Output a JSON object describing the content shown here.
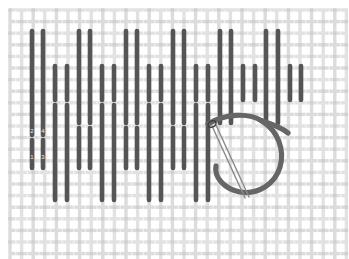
{
  "figure": {
    "width": 349,
    "height": 259
  },
  "colors": {
    "background": "#ffffff",
    "fabric_warp": "#e2e2e2",
    "fabric_weft": "#dcdcdc",
    "fabric_cross": "#d0d0d0",
    "stitch": "#555555",
    "stitch_dark": "#4a4a4a",
    "thread": "#666666",
    "needle": "#8a8a8a",
    "digit_label": "#ececec"
  },
  "fabric": {
    "type": "even-weave-canvas",
    "origin_x": 10,
    "origin_y": 10,
    "extent_x": 338,
    "extent_y": 250,
    "pitch": 11.6,
    "thread_width": 3.4,
    "gap_width": 1.2
  },
  "stitch_style": {
    "width": 4.6,
    "cap": "round",
    "color": "#555555"
  },
  "stitch_columns": [
    {
      "id": "c01",
      "x": 32,
      "segments": [
        [
          31,
          135
        ],
        [
          140,
          168
        ]
      ]
    },
    {
      "id": "c02",
      "x": 43,
      "segments": [
        [
          31,
          135
        ],
        [
          140,
          168
        ]
      ]
    },
    {
      "id": "c03",
      "x": 55,
      "segments": [
        [
          66,
          100
        ],
        [
          105,
          200
        ]
      ]
    },
    {
      "id": "c04",
      "x": 67,
      "segments": [
        [
          66,
          100
        ],
        [
          105,
          200
        ]
      ]
    },
    {
      "id": "c05",
      "x": 79,
      "segments": [
        [
          31,
          123
        ],
        [
          128,
          168
        ]
      ]
    },
    {
      "id": "c06",
      "x": 90,
      "segments": [
        [
          31,
          123
        ],
        [
          128,
          168
        ]
      ]
    },
    {
      "id": "c07",
      "x": 102,
      "segments": [
        [
          66,
          100
        ],
        [
          105,
          200
        ]
      ]
    },
    {
      "id": "c08",
      "x": 114,
      "segments": [
        [
          66,
          100
        ],
        [
          105,
          200
        ]
      ]
    },
    {
      "id": "c09",
      "x": 126,
      "segments": [
        [
          31,
          123
        ],
        [
          128,
          168
        ]
      ]
    },
    {
      "id": "c10",
      "x": 137,
      "segments": [
        [
          31,
          123
        ],
        [
          128,
          168
        ]
      ]
    },
    {
      "id": "c11",
      "x": 149,
      "segments": [
        [
          66,
          100
        ],
        [
          105,
          200
        ]
      ]
    },
    {
      "id": "c12",
      "x": 161,
      "segments": [
        [
          66,
          100
        ],
        [
          105,
          200
        ]
      ]
    },
    {
      "id": "c13",
      "x": 173,
      "segments": [
        [
          31,
          123
        ],
        [
          128,
          168
        ]
      ]
    },
    {
      "id": "c14",
      "x": 184,
      "segments": [
        [
          31,
          123
        ],
        [
          128,
          168
        ]
      ]
    },
    {
      "id": "c15",
      "x": 196,
      "segments": [
        [
          66,
          100
        ],
        [
          105,
          200
        ]
      ]
    },
    {
      "id": "c16",
      "x": 208,
      "segments": [
        [
          66,
          100
        ],
        [
          105,
          200
        ]
      ]
    },
    {
      "id": "c17",
      "x": 220,
      "segments": [
        [
          31,
          123
        ]
      ]
    },
    {
      "id": "c18",
      "x": 231,
      "segments": [
        [
          31,
          123
        ]
      ]
    },
    {
      "id": "c19",
      "x": 243,
      "segments": [
        [
          66,
          100
        ]
      ]
    },
    {
      "id": "c20",
      "x": 255,
      "segments": [
        [
          66,
          100
        ]
      ]
    },
    {
      "id": "c21",
      "x": 266,
      "segments": [
        [
          31,
          123
        ]
      ]
    },
    {
      "id": "c22",
      "x": 278,
      "segments": [
        [
          31,
          123
        ]
      ]
    },
    {
      "id": "c23",
      "x": 290,
      "segments": [
        [
          66,
          100
        ]
      ]
    },
    {
      "id": "c24",
      "x": 301,
      "segments": [
        [
          66,
          100
        ]
      ]
    }
  ],
  "sequence_labels": [
    {
      "id": "lbl-2",
      "text": "2",
      "x": 32,
      "y": 131
    },
    {
      "id": "lbl-4",
      "text": "4",
      "x": 43,
      "y": 131
    },
    {
      "id": "lbl-1",
      "text": "1",
      "x": 32,
      "y": 157
    },
    {
      "id": "lbl-3",
      "text": "3",
      "x": 43,
      "y": 157
    }
  ],
  "working_thread": {
    "id": "thread-loop",
    "color": "#666666",
    "width": 5.2,
    "path": "M 208 124 C 224 114, 248 112, 262 121 C 278 131, 285 150, 280 167 C 275 184, 258 195, 240 192 C 224 189, 214 177, 216 166",
    "tail_path": "M 262 121 C 272 124, 282 128, 288 133"
  },
  "needle": {
    "id": "sewing-needle",
    "color": "#8a8a8a",
    "width": 1.4,
    "shaft_a": "M 212 126 L 245 198",
    "shaft_b": "M 216 125 L 249 197",
    "eye_cx": 212,
    "eye_cy": 124,
    "eye_rx": 4.2,
    "eye_ry": 3.0,
    "eye_rotation": -28
  },
  "annotation": {
    "stitch_count": 24,
    "label_count": 4,
    "note": "Numbers 1-4 mark needle entry and exit order of the first stitch pair."
  }
}
